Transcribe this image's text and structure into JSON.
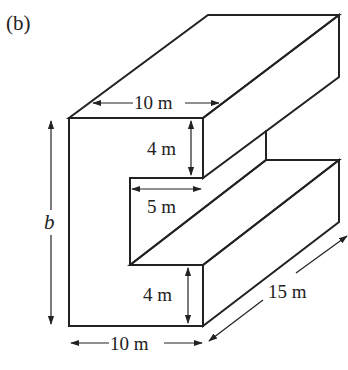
{
  "figure": {
    "panel_label": "(b)",
    "colors": {
      "front_face_fill": "#d9d9d9",
      "line": "#222222",
      "background": "#ffffff"
    },
    "dimensions": {
      "top_width": "10 m",
      "top_arm_thickness": "4 m",
      "notch_depth": "5 m",
      "height": "b",
      "bottom_arm_thickness": "4 m",
      "bottom_width": "10 m",
      "length": "15 m"
    }
  }
}
